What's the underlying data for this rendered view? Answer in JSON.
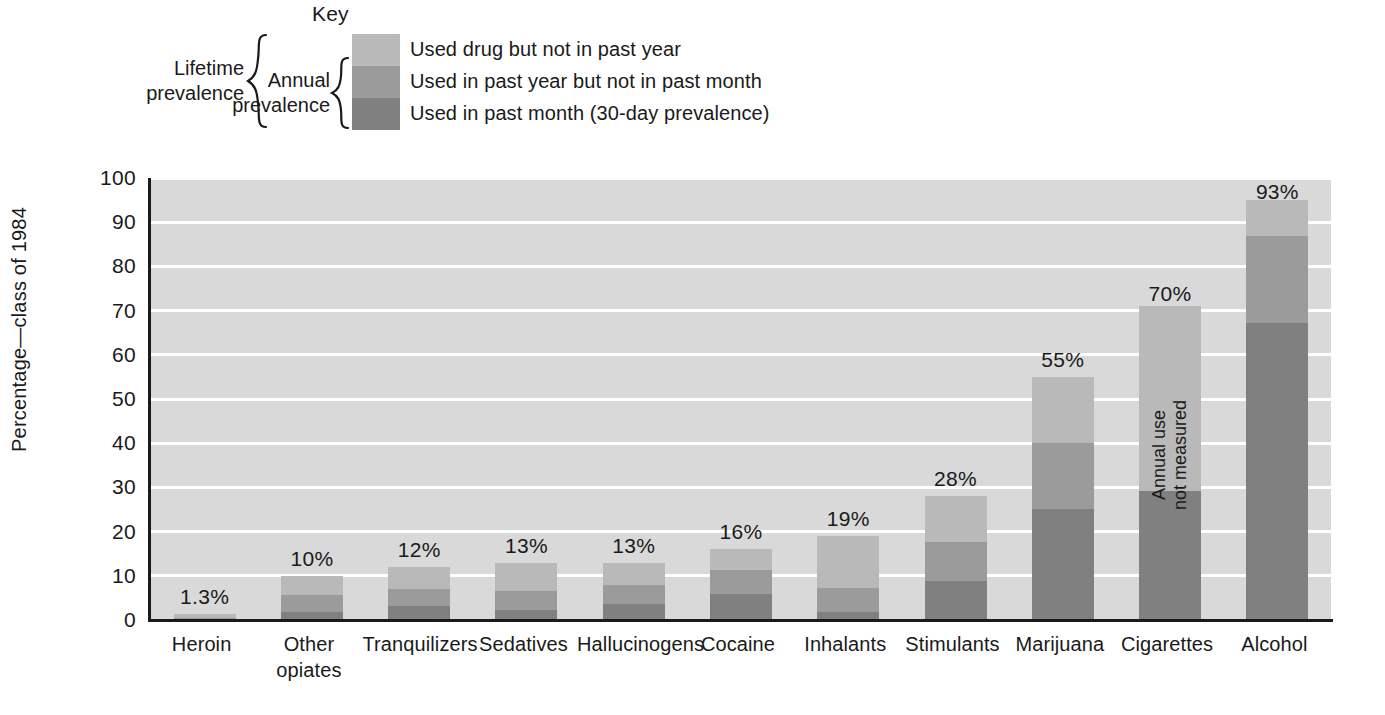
{
  "legend": {
    "title": "Key",
    "lifetime_bracket_label": "Lifetime\nprevalence",
    "lifetime_line1": "Lifetime",
    "lifetime_line2": "prevalence",
    "annual_line1": "Annual",
    "annual_line2": "prevalence",
    "items": [
      {
        "label": "Used drug but not in past year",
        "color": "#b9b9b9",
        "key": "lifetime_only"
      },
      {
        "label": "Used in past year but not in past month",
        "color": "#9b9b9b",
        "key": "annual_only"
      },
      {
        "label": "Used in past month (30-day prevalence)",
        "color": "#808080",
        "key": "past_month"
      }
    ]
  },
  "chart_data": {
    "type": "bar",
    "subtype": "stacked",
    "title": "",
    "xlabel": "",
    "ylabel": "Percentage—class of 1984",
    "ylim": [
      0,
      100
    ],
    "yticks": [
      0,
      10,
      20,
      30,
      40,
      50,
      60,
      70,
      80,
      90,
      100
    ],
    "ytick_labels": [
      "0",
      "10",
      "20",
      "30",
      "40",
      "50",
      "60",
      "70",
      "80",
      "90",
      "100"
    ],
    "grid": "horizontal",
    "legend_position": "above-plot",
    "categories": [
      "Heroin",
      "Other opiates",
      "Tranquilizers",
      "Sedatives",
      "Hallucinogens",
      "Cocaine",
      "Inhalants",
      "Stimulants",
      "Marijuana",
      "Cigarettes",
      "Alcohol"
    ],
    "category_lines": [
      [
        "Heroin"
      ],
      [
        "Other",
        "opiates"
      ],
      [
        "Tranquilizers"
      ],
      [
        "Sedatives"
      ],
      [
        "Hallucinogens"
      ],
      [
        "Cocaine"
      ],
      [
        "Inhalants"
      ],
      [
        "Stimulants"
      ],
      [
        "Marijuana"
      ],
      [
        "Cigarettes"
      ],
      [
        "Alcohol"
      ]
    ],
    "series": [
      {
        "name": "Used in past month (30-day prevalence)",
        "color": "#808080",
        "values": [
          0.3,
          1.8,
          3.1,
          2.3,
          3.6,
          5.8,
          1.9,
          8.9,
          25.2,
          29.3,
          67.2
        ]
      },
      {
        "name": "Used in past year but not in past month",
        "color": "#9b9b9b",
        "values": [
          0.2,
          3.9,
          3.9,
          4.3,
          4.3,
          5.5,
          5.4,
          8.8,
          14.8,
          0,
          19.6
        ]
      },
      {
        "name": "Used drug but not in past year",
        "color": "#b9b9b9",
        "values": [
          0.8,
          4.3,
          5.0,
          6.4,
          5.1,
          4.7,
          11.7,
          10.3,
          15.0,
          41.7,
          8.2
        ]
      }
    ],
    "totals": [
      1.3,
      10,
      12,
      13,
      13,
      16,
      19,
      28,
      55,
      70,
      93
    ],
    "value_labels": [
      "1.3%",
      "10%",
      "12%",
      "13%",
      "13%",
      "16%",
      "19%",
      "28%",
      "55%",
      "70%",
      "93%"
    ],
    "annotations": [
      {
        "category": "Cigarettes",
        "text_line1": "Annual use",
        "text_line2": "not measured",
        "rotation": -90
      }
    ]
  }
}
